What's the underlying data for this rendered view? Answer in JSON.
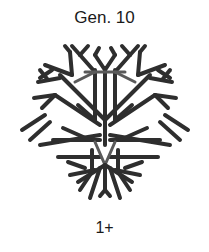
{
  "figure": {
    "title": "Gen. 10",
    "label": "1+",
    "image": "fractal-branching-tree",
    "colors": {
      "branch": "#2e2e2e",
      "inner_branch": "#5a5a5a",
      "background": "#ffffff"
    }
  }
}
